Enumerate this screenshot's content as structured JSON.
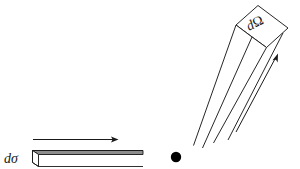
{
  "figure": {
    "background_color": "#ffffff",
    "stroke_color": "#1a1a1a",
    "shade_color": "#8c8c8c",
    "width": 300,
    "height": 169
  },
  "incident_beam": {
    "label_d": "d",
    "label_symbol": "σ",
    "label_full": "dσ",
    "description": "incident flux slab of cross-sectional area d-sigma",
    "top_face_fill": "#8c8c8c",
    "direction_arrow": {
      "name": "incident-direction-arrow",
      "points_to": "right"
    }
  },
  "scattering_center": {
    "name": "scattering-center-dot",
    "color": "#000000",
    "radius": 5.2
  },
  "solid_angle_tube": {
    "label_d": "d",
    "label_symbol": "Ω",
    "label_full": "dΩ",
    "description": "outgoing beam subtending solid angle d-Omega",
    "face_fill": "#ffffff",
    "direction_arrow": {
      "name": "scattered-direction-arrow",
      "points_to": "up-right"
    }
  }
}
